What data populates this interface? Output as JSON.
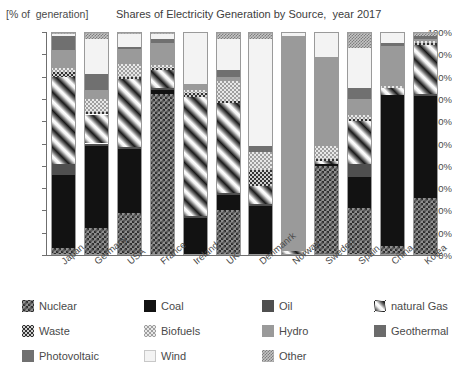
{
  "header": {
    "axis_unit": "[% of  generation]",
    "title": "Shares of Electricity Generation by Source,  year 2017"
  },
  "yaxis": {
    "ticks": [
      "100%",
      "90%",
      "80%",
      "70%",
      "60%",
      "50%",
      "40%",
      "30%",
      "20%",
      "10%",
      "0%"
    ]
  },
  "legend": {
    "items": [
      {
        "label": "Nuclear",
        "key": "nuclear",
        "swatch": "p-nuclear"
      },
      {
        "label": "Coal",
        "key": "coal",
        "swatch": "p-coal"
      },
      {
        "label": "Oil",
        "key": "oil",
        "swatch": "p-oil"
      },
      {
        "label": "natural Gas",
        "key": "gas",
        "swatch": "p-gas"
      },
      {
        "label": "Waste",
        "key": "waste",
        "swatch": "p-waste"
      },
      {
        "label": "Biofuels",
        "key": "biofuels",
        "swatch": "p-biofuel"
      },
      {
        "label": "Hydro",
        "key": "hydro",
        "swatch": "p-hydro"
      },
      {
        "label": "Geothermal",
        "key": "geo",
        "swatch": "p-geo"
      },
      {
        "label": "Photovoltaic",
        "key": "pv",
        "swatch": "p-pv"
      },
      {
        "label": "Wind",
        "key": "wind",
        "swatch": "p-wind"
      },
      {
        "label": "Other",
        "key": "other",
        "swatch": "p-other"
      }
    ]
  },
  "chart_data": {
    "type": "bar",
    "stacked": true,
    "title": "Shares of Electricity Generation by Source,  year 2017",
    "xlabel": "",
    "ylabel": "[% of  generation]",
    "ylim": [
      0,
      100
    ],
    "ytick_step": 10,
    "grid": false,
    "legend_position": "bottom",
    "categories": [
      "Japan",
      "Germany",
      "USA",
      "France",
      "Ireland",
      "UK",
      "Denmanrk",
      "Norway",
      "Sweden",
      "Spain",
      "China",
      "Korea"
    ],
    "series": [
      {
        "name": "Nuclear",
        "key": "nuclear",
        "swatch": "p-nuclear",
        "values": [
          3,
          12,
          20,
          72,
          0,
          20,
          0,
          0,
          40,
          21,
          4,
          26
        ]
      },
      {
        "name": "Coal",
        "key": "coal",
        "swatch": "p-coal",
        "values": [
          33,
          37,
          30,
          2,
          17,
          7,
          22,
          0,
          1,
          14,
          67,
          46
        ]
      },
      {
        "name": "Oil",
        "key": "oil",
        "swatch": "p-oil",
        "values": [
          5,
          1,
          1,
          1,
          1,
          1,
          1,
          0,
          0,
          6,
          0,
          1
        ]
      },
      {
        "name": "natural Gas",
        "key": "gas",
        "swatch": "p-gas",
        "values": [
          39,
          13,
          32,
          8,
          55,
          40,
          8,
          2,
          1,
          19,
          3,
          22
        ]
      },
      {
        "name": "Waste",
        "key": "waste",
        "swatch": "p-waste",
        "values": [
          2,
          1,
          1,
          1,
          2,
          1,
          7,
          0,
          1,
          1,
          0,
          1
        ]
      },
      {
        "name": "Biofuels",
        "key": "biofuels",
        "swatch": "p-biofuel",
        "values": [
          2,
          6,
          6,
          1,
          1,
          9,
          8,
          0,
          6,
          2,
          1,
          1
        ]
      },
      {
        "name": "Hydro",
        "key": "hydro",
        "swatch": "p-hydro",
        "values": [
          8,
          4,
          7,
          10,
          3,
          2,
          0,
          96,
          40,
          7,
          18,
          1
        ]
      },
      {
        "name": "Geothermal",
        "key": "geo",
        "swatch": "p-geo",
        "values": [
          0,
          0,
          0,
          0,
          0,
          0,
          0,
          0,
          0,
          0,
          0,
          0
        ]
      },
      {
        "name": "Photovoltaic",
        "key": "pv",
        "swatch": "p-pv",
        "values": [
          6,
          7,
          1,
          2,
          0,
          3,
          3,
          0,
          0,
          5,
          1,
          1
        ]
      },
      {
        "name": "Wind",
        "key": "wind",
        "swatch": "p-wind",
        "values": [
          1,
          16,
          6,
          2,
          24,
          14,
          48,
          2,
          11,
          18,
          5,
          0
        ]
      },
      {
        "name": "Other",
        "key": "other",
        "swatch": "p-other",
        "values": [
          1,
          3,
          1,
          1,
          0,
          3,
          3,
          0,
          0,
          7,
          0,
          2
        ]
      }
    ]
  }
}
